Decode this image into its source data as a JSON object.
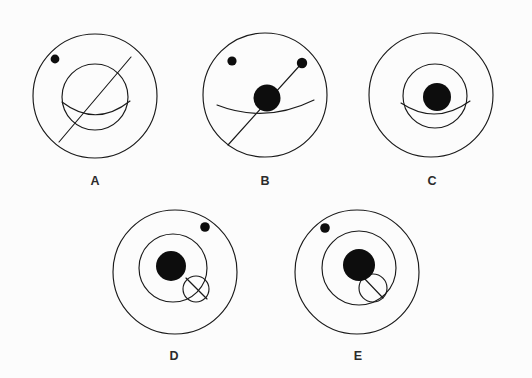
{
  "figure": {
    "background_color": "#fcfcfc",
    "stroke_color": "#1a1a1a",
    "fill_color": "#0d0d0d",
    "label_color": "#2b2b2b",
    "panels": [
      {
        "id": "A",
        "label": "A",
        "label_x": 95,
        "label_y": 185,
        "outer_circle": {
          "cx": 95,
          "cy": 96,
          "r": 62
        },
        "inner_circle": {
          "cx": 95,
          "cy": 97,
          "r": 33
        },
        "nucleus": null,
        "arc": {
          "x1": 62,
          "y1": 102,
          "x2": 130,
          "y2": 101,
          "sweep_y": 128
        },
        "diagonal_line": {
          "x1": 131,
          "y1": 57,
          "x2": 59,
          "y2": 142
        },
        "satellite_dot": {
          "cx": 55,
          "cy": 59,
          "r": 4.4
        },
        "secondary_dot": null,
        "small_circle": null
      },
      {
        "id": "B",
        "label": "B",
        "label_x": 265,
        "label_y": 185,
        "outer_circle": {
          "cx": 265,
          "cy": 95,
          "r": 62
        },
        "inner_circle": null,
        "nucleus": {
          "cx": 267,
          "cy": 98,
          "r": 13.5
        },
        "arc": {
          "x1": 217,
          "y1": 105,
          "x2": 314,
          "y2": 100,
          "sweep_y": 124
        },
        "diagonal_line": {
          "x1": 302,
          "y1": 63,
          "x2": 228,
          "y2": 145
        },
        "satellite_dot": {
          "cx": 232,
          "cy": 61,
          "r": 4.6
        },
        "secondary_dot": {
          "cx": 302,
          "cy": 63,
          "r": 5.2
        },
        "small_circle": null
      },
      {
        "id": "C",
        "label": "C",
        "label_x": 432,
        "label_y": 185,
        "outer_circle": {
          "cx": 431,
          "cy": 95,
          "r": 62
        },
        "inner_circle": {
          "cx": 435,
          "cy": 96,
          "r": 32
        },
        "nucleus": {
          "cx": 437,
          "cy": 97,
          "r": 14
        },
        "arc": {
          "x1": 401,
          "y1": 103,
          "x2": 470,
          "y2": 101,
          "sweep_y": 126
        },
        "diagonal_line": null,
        "satellite_dot": null,
        "secondary_dot": null,
        "small_circle": null
      },
      {
        "id": "D",
        "label": "D",
        "label_x": 174,
        "label_y": 360,
        "outer_circle": {
          "cx": 175,
          "cy": 272,
          "r": 62
        },
        "inner_circle": {
          "cx": 173,
          "cy": 268,
          "r": 34
        },
        "nucleus": {
          "cx": 171,
          "cy": 266,
          "r": 15
        },
        "arc": null,
        "diagonal_line": {
          "x1": 186,
          "y1": 278,
          "x2": 207,
          "y2": 299
        },
        "satellite_dot": {
          "cx": 205,
          "cy": 227,
          "r": 4.8
        },
        "secondary_dot": null,
        "small_circle": {
          "cx": 196,
          "cy": 289,
          "r": 13
        }
      },
      {
        "id": "E",
        "label": "E",
        "label_x": 358,
        "label_y": 360,
        "outer_circle": {
          "cx": 357,
          "cy": 272,
          "r": 62
        },
        "inner_circle": {
          "cx": 359,
          "cy": 268,
          "r": 37
        },
        "nucleus": {
          "cx": 359,
          "cy": 265,
          "r": 16
        },
        "arc": null,
        "diagonal_line": {
          "x1": 363,
          "y1": 277,
          "x2": 383,
          "y2": 298
        },
        "satellite_dot": {
          "cx": 325,
          "cy": 228,
          "r": 4.8
        },
        "secondary_dot": null,
        "small_circle": {
          "cx": 373,
          "cy": 288,
          "r": 14
        }
      }
    ]
  }
}
